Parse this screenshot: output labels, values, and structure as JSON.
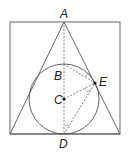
{
  "diagram": {
    "type": "geometry",
    "labels": {
      "A": "A",
      "B": "B",
      "C": "C",
      "D": "D",
      "E": "E"
    },
    "points": {
      "A": [
        64,
        22
      ],
      "B": [
        64,
        64
      ],
      "C": [
        64,
        99
      ],
      "D": [
        64,
        134
      ],
      "E": [
        95,
        83
      ]
    },
    "square": {
      "x": 10,
      "y": 22,
      "w": 110,
      "h": 112
    },
    "circle": {
      "cx": 64,
      "cy": 99,
      "r": 35
    },
    "colors": {
      "stroke": "#555555",
      "point": "#111111",
      "label": "#222222"
    }
  }
}
